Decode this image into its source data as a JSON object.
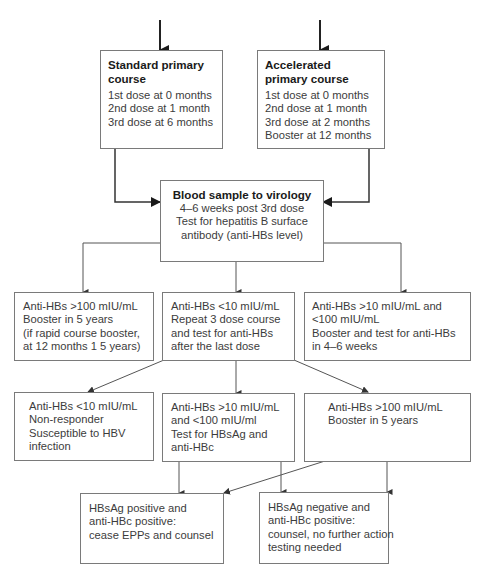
{
  "diagram": {
    "start_boxes": [
      {
        "title": "Standard primary course",
        "title_lines": [
          "Standard primary",
          "course"
        ],
        "lines": [
          "1st dose at 0 months",
          "2nd dose at 1 month",
          "3rd dose at 6 months"
        ]
      },
      {
        "title": "Accelerated primary course",
        "title_lines": [
          "Accelerated",
          "primary course"
        ],
        "lines": [
          "1st dose at 0 months",
          "2nd dose at 1 month",
          "3rd dose at 2 months",
          "Booster at 12 months"
        ]
      }
    ],
    "virology_box": {
      "title": "Blood sample to virology",
      "lines": [
        "4–6 weeks post 3rd dose",
        "Test for hepatitis B surface",
        "antibody (anti-HBs level)"
      ]
    },
    "first_results": [
      {
        "lines": [
          "Anti-HBs >100 mIU/mL",
          "Booster in 5 years",
          "(if rapid course booster,",
          "at 12 months 1 5 years)"
        ]
      },
      {
        "lines": [
          "Anti-HBs <10 mIU/mL",
          "Repeat 3 dose course",
          "and test for anti-HBs",
          "after the last dose"
        ]
      },
      {
        "lines": [
          "Anti-HBs >10 mIU/mL and",
          "<100 mIU/mL",
          "Booster and test for anti-HBs",
          "in 4–6 weeks"
        ]
      }
    ],
    "second_results": [
      {
        "lines": [
          "Anti-HBs <10 mIU/mL",
          "Non-responder",
          "Susceptible to HBV",
          "infection"
        ]
      },
      {
        "lines": [
          "Anti-HBs >10 mIU/mL",
          "and <100 mIU/ml",
          "Test for HBsAg and",
          "anti-HBc"
        ]
      },
      {
        "lines": [
          "Anti-HBs >100 mIU/mL",
          "Booster in 5 years"
        ]
      }
    ],
    "final_outcomes": [
      {
        "lines": [
          "HBsAg positive and",
          "anti-HBc positive:",
          "cease EPPs and counsel"
        ]
      },
      {
        "lines": [
          "HBsAg negative and",
          "anti-HBc positive:",
          "counsel, no further action",
          "testing needed"
        ]
      }
    ],
    "colors": {
      "border": "#7a7a7a",
      "connector": "#555555",
      "entry_arrow": "#222222",
      "title_text": "#1a1a1a",
      "body_text": "#3c3c3c"
    }
  }
}
